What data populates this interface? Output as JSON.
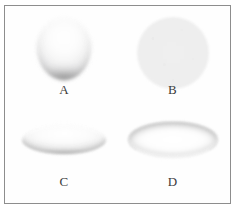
{
  "figure": {
    "background_color": "#ffffff",
    "frame_border_color": "#8d8d8d",
    "panels": [
      {
        "id": "a",
        "label": "A",
        "shape_name": "sphere-droplet",
        "description": "spherical droplet with crescent shading along lower rim",
        "fill_color": "#f7f7f7",
        "shade_color": "#787878"
      },
      {
        "id": "b",
        "label": "B",
        "shape_name": "flat-disc",
        "description": "uniform flat light-gray circle",
        "fill_color": "#eeeeee",
        "shade_color": "#ececec"
      },
      {
        "id": "c",
        "label": "C",
        "shape_name": "flattened-ellipsoid",
        "description": "oblate pancake droplet with soft shadow beneath",
        "fill_color": "#fbfbfb",
        "shade_color": "#7d7d7d"
      },
      {
        "id": "d",
        "label": "D",
        "shape_name": "flat-ellipse-ring",
        "description": "thin flat ellipse with darker upper rim outline",
        "fill_color": "#fdfdfd",
        "shade_color": "#a0a0a0"
      }
    ]
  }
}
